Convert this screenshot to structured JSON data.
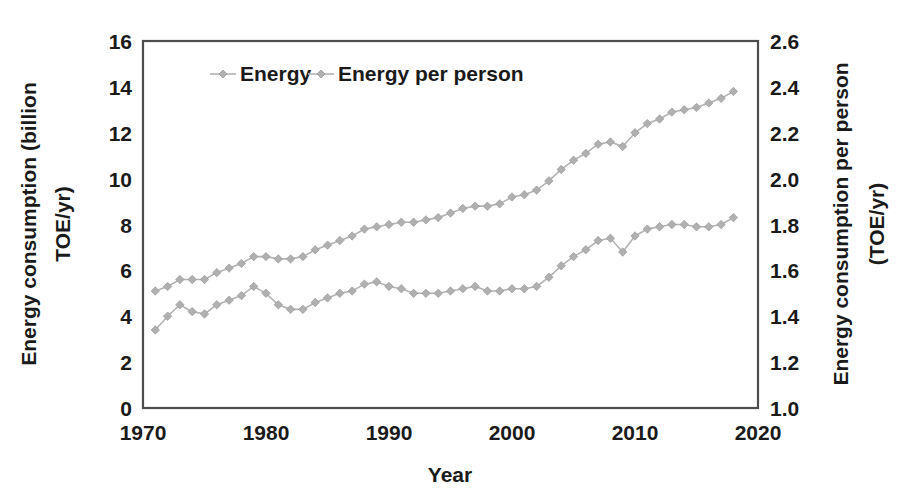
{
  "chart_data": {
    "type": "line",
    "title": "",
    "xlabel": "Year",
    "ylabel": "Energy consumption  (billion TOE/yr)",
    "y2label": "Energy consumption per person (TOE/yr)",
    "xlim": [
      1970,
      2020
    ],
    "ylim": [
      0,
      16
    ],
    "y2lim": [
      1.0,
      2.6
    ],
    "grid": false,
    "legend_position": "top-center-inside",
    "xticks": [
      "1970",
      "1980",
      "1990",
      "2000",
      "2010",
      "2020"
    ],
    "xtick_values": [
      1970,
      1980,
      1990,
      2000,
      2010,
      2020
    ],
    "yticks": [
      "0",
      "2",
      "4",
      "6",
      "8",
      "10",
      "12",
      "14",
      "16"
    ],
    "ytick_values": [
      0,
      2,
      4,
      6,
      8,
      10,
      12,
      14,
      16
    ],
    "y2ticks": [
      "1.0",
      "1.2",
      "1.4",
      "1.6",
      "1.8",
      "2.0",
      "2.2",
      "2.4",
      "2.6"
    ],
    "y2tick_values": [
      1.0,
      1.2,
      1.4,
      1.6,
      1.8,
      2.0,
      2.2,
      2.4,
      2.6
    ],
    "marker": "diamond",
    "line_color": "#b3b3b3",
    "marker_color": "#b0b0b0",
    "frame_color": "#4d4d4d",
    "text_color": "#1a1a1a",
    "x": [
      1971,
      1972,
      1973,
      1974,
      1975,
      1976,
      1977,
      1978,
      1979,
      1980,
      1981,
      1982,
      1983,
      1984,
      1985,
      1986,
      1987,
      1988,
      1989,
      1990,
      1991,
      1992,
      1993,
      1994,
      1995,
      1996,
      1997,
      1998,
      1999,
      2000,
      2001,
      2002,
      2003,
      2004,
      2005,
      2006,
      2007,
      2008,
      2009,
      2010,
      2011,
      2012,
      2013,
      2014,
      2015,
      2016,
      2017,
      2018
    ],
    "series": [
      {
        "name": "Energy",
        "axis": "left",
        "unit": "billion TOE/yr",
        "values": [
          5.1,
          5.3,
          5.6,
          5.6,
          5.6,
          5.9,
          6.1,
          6.3,
          6.6,
          6.6,
          6.5,
          6.5,
          6.6,
          6.9,
          7.1,
          7.3,
          7.5,
          7.8,
          7.9,
          8.0,
          8.1,
          8.1,
          8.2,
          8.3,
          8.5,
          8.7,
          8.8,
          8.8,
          8.9,
          9.2,
          9.3,
          9.5,
          9.9,
          10.4,
          10.8,
          11.1,
          11.5,
          11.6,
          11.4,
          12.0,
          12.4,
          12.6,
          12.9,
          13.0,
          13.1,
          13.3,
          13.5,
          13.8
        ]
      },
      {
        "name": "Energy per person",
        "axis": "right",
        "unit": "TOE/yr",
        "values": [
          1.34,
          1.4,
          1.45,
          1.42,
          1.41,
          1.45,
          1.47,
          1.49,
          1.53,
          1.5,
          1.45,
          1.43,
          1.43,
          1.46,
          1.48,
          1.5,
          1.51,
          1.54,
          1.55,
          1.53,
          1.52,
          1.5,
          1.5,
          1.5,
          1.51,
          1.52,
          1.53,
          1.51,
          1.51,
          1.52,
          1.52,
          1.53,
          1.57,
          1.62,
          1.66,
          1.69,
          1.73,
          1.74,
          1.68,
          1.75,
          1.78,
          1.79,
          1.8,
          1.8,
          1.79,
          1.79,
          1.8,
          1.83
        ]
      }
    ]
  },
  "legend": {
    "items": [
      {
        "label": "Energy"
      },
      {
        "label": "Energy per person"
      }
    ]
  },
  "axes": {
    "x_title": "Year",
    "y_left_title_line1": "Energy consumption  (billion",
    "y_left_title_line2": "TOE/yr)",
    "y_right_title_line1": "Energy consumption per person",
    "y_right_title_line2": "(TOE/yr)"
  }
}
